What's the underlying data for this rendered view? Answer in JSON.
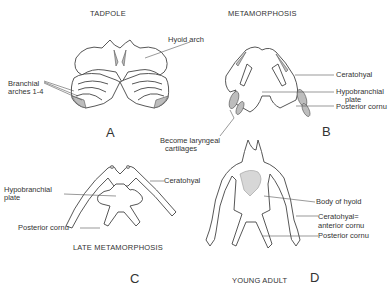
{
  "figure": {
    "panels": [
      {
        "id": "A",
        "title": "TADPOLE",
        "letter": "A",
        "labels": [
          "Branchial",
          "arches 1-4"
        ]
      },
      {
        "id": "B",
        "title": "METAMORPHOSIS",
        "letter": "B",
        "labels": {
          "hyoid_arch": "Hyoid arch",
          "ceratohyal": "Ceratohyal",
          "hypobranchial_1": "Hypobranchial",
          "hypobranchial_2": "plate",
          "posterior_cornu": "Posterior  cornu",
          "laryngeal_1": "Become laryngeal",
          "laryngeal_2": "cartilages"
        }
      },
      {
        "id": "C",
        "title": "LATE  METAMORPHOSIS",
        "letter": "C",
        "labels": {
          "hypobranchial_1": "Hypobranchial",
          "hypobranchial_2": "plate",
          "ceratohyal": "Ceratohyal",
          "posterior_cornu": "Posterior cornu"
        }
      },
      {
        "id": "D",
        "title": "YOUNG  ADULT",
        "letter": "D",
        "labels": {
          "body_of_hyoid": "Body of hyoid",
          "ceratohyal_1": "Ceratohyal=",
          "ceratohyal_2": "anterior cornu",
          "posterior_cornu": "Posterior cornu"
        }
      }
    ]
  }
}
